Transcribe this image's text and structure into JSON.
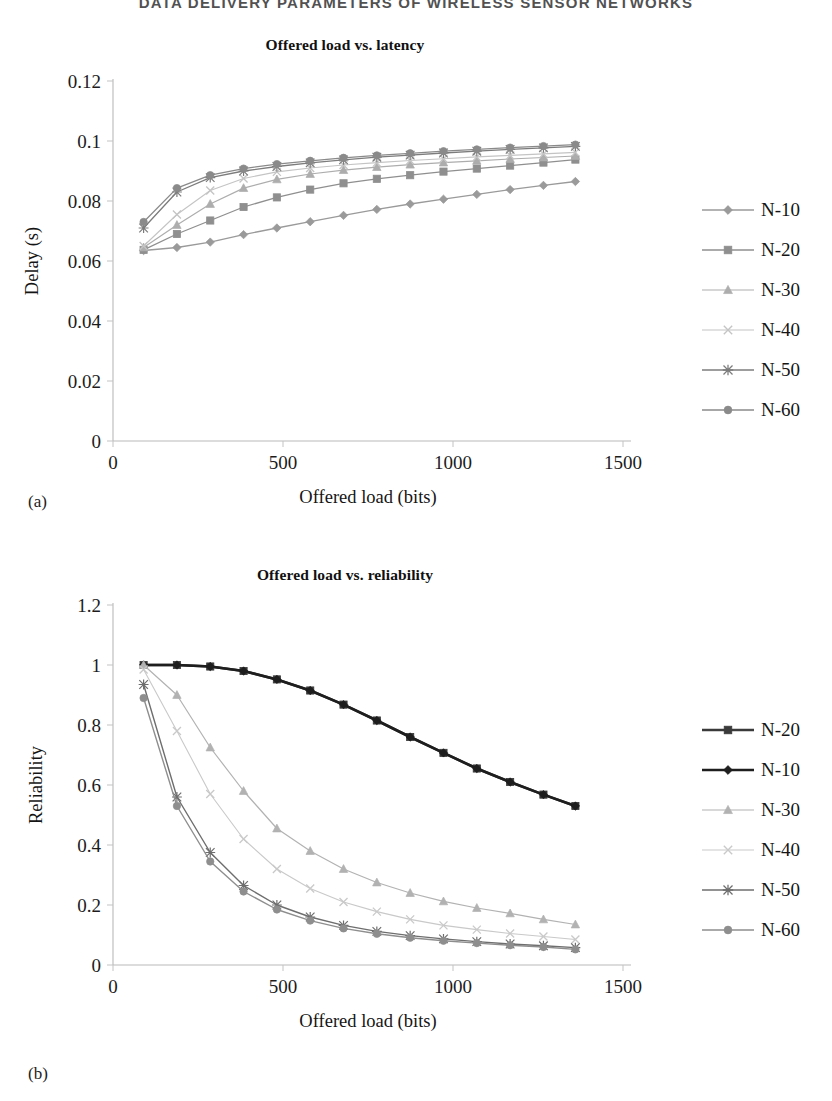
{
  "running_head": "DATA DELIVERY PARAMETERS OF WIRELESS SENSOR NETWORKS",
  "figures": [
    {
      "key": "a",
      "subfig_label": "(a)",
      "title": "Offered load vs. latency",
      "legend": [
        {
          "label": "N-10",
          "marker": "diamond",
          "color": "#9a9a9a",
          "width": 1.3
        },
        {
          "label": "N-20",
          "marker": "square",
          "color": "#8f8f8f",
          "width": 1.3
        },
        {
          "label": "N-30",
          "marker": "triangle",
          "color": "#adadad",
          "width": 1.2
        },
        {
          "label": "N-40",
          "marker": "cross",
          "color": "#c4c4c4",
          "width": 1.1
        },
        {
          "label": "N-50",
          "marker": "star",
          "color": "#7c7c7c",
          "width": 1.3
        },
        {
          "label": "N-60",
          "marker": "circle",
          "color": "#8a8a8a",
          "width": 1.3
        }
      ],
      "chart_data": {
        "type": "line",
        "title": "Offered load vs. latency",
        "xlabel": "Offered load (bits)",
        "ylabel": "Delay (s)",
        "xlim": [
          0,
          1500
        ],
        "ylim": [
          0,
          0.12
        ],
        "xticks": [
          "0",
          "500",
          "1000",
          "1500"
        ],
        "yticks": [
          "0",
          "0.02",
          "0.04",
          "0.06",
          "0.08",
          "0.1",
          "0.12"
        ],
        "grid": false,
        "legend_position": "right",
        "x": [
          90,
          188,
          286,
          384,
          482,
          580,
          678,
          776,
          874,
          972,
          1070,
          1168,
          1266,
          1360
        ],
        "series": [
          {
            "name": "N-10",
            "values": [
              0.0635,
              0.0645,
              0.0663,
              0.0688,
              0.071,
              0.0731,
              0.0752,
              0.0772,
              0.079,
              0.0806,
              0.0822,
              0.0838,
              0.0852,
              0.0865
            ]
          },
          {
            "name": "N-20",
            "values": [
              0.0637,
              0.069,
              0.0735,
              0.078,
              0.0812,
              0.0838,
              0.0859,
              0.0874,
              0.0886,
              0.0898,
              0.0908,
              0.0918,
              0.0928,
              0.0938
            ]
          },
          {
            "name": "N-30",
            "values": [
              0.0645,
              0.072,
              0.079,
              0.0843,
              0.0872,
              0.089,
              0.0903,
              0.0913,
              0.0921,
              0.0928,
              0.0934,
              0.094,
              0.0945,
              0.095
            ]
          },
          {
            "name": "N-40",
            "values": [
              0.065,
              0.0755,
              0.0835,
              0.0875,
              0.0897,
              0.091,
              0.092,
              0.0928,
              0.0935,
              0.0941,
              0.0947,
              0.0952,
              0.0957,
              0.0962
            ]
          },
          {
            "name": "N-50",
            "values": [
              0.071,
              0.083,
              0.0878,
              0.09,
              0.0915,
              0.0927,
              0.0937,
              0.0946,
              0.0953,
              0.096,
              0.0966,
              0.0972,
              0.0977,
              0.0982
            ]
          },
          {
            "name": "N-60",
            "values": [
              0.073,
              0.0843,
              0.0886,
              0.0908,
              0.0923,
              0.0934,
              0.0944,
              0.0952,
              0.0959,
              0.0966,
              0.0972,
              0.0978,
              0.0983,
              0.0988
            ]
          }
        ]
      }
    },
    {
      "key": "b",
      "subfig_label": "(b)",
      "title": "Offered load vs. reliability",
      "legend": [
        {
          "label": "N-20",
          "marker": "square",
          "color": "#3a3a3a",
          "width": 2.6
        },
        {
          "label": "N-10",
          "marker": "diamond",
          "color": "#1e1e1e",
          "width": 2.6
        },
        {
          "label": "N-30",
          "marker": "triangle",
          "color": "#b2b2b2",
          "width": 1.2
        },
        {
          "label": "N-40",
          "marker": "cross",
          "color": "#c9c9c9",
          "width": 1.1
        },
        {
          "label": "N-50",
          "marker": "star",
          "color": "#6e6e6e",
          "width": 1.4
        },
        {
          "label": "N-60",
          "marker": "circle",
          "color": "#8e8e8e",
          "width": 1.4
        }
      ],
      "chart_data": {
        "type": "line",
        "title": "Offered load vs. reliability",
        "xlabel": "Offered load (bits)",
        "ylabel": "Reliability",
        "xlim": [
          0,
          1500
        ],
        "ylim": [
          0,
          1.2
        ],
        "xticks": [
          "0",
          "500",
          "1000",
          "1500"
        ],
        "yticks": [
          "0",
          "0.2",
          "0.4",
          "0.6",
          "0.8",
          "1",
          "1.2"
        ],
        "grid": false,
        "legend_position": "right",
        "x": [
          90,
          188,
          286,
          384,
          482,
          580,
          678,
          776,
          874,
          972,
          1070,
          1168,
          1266,
          1360
        ],
        "series": [
          {
            "name": "N-20",
            "values": [
              1.0,
              1.0,
              0.995,
              0.98,
              0.952,
              0.915,
              0.868,
              0.815,
              0.76,
              0.707,
              0.655,
              0.61,
              0.568,
              0.53
            ]
          },
          {
            "name": "N-10",
            "values": [
              1.0,
              1.0,
              0.995,
              0.98,
              0.952,
              0.915,
              0.868,
              0.815,
              0.76,
              0.707,
              0.655,
              0.61,
              0.568,
              0.53
            ]
          },
          {
            "name": "N-30",
            "values": [
              1.0,
              0.9,
              0.725,
              0.58,
              0.455,
              0.38,
              0.32,
              0.275,
              0.24,
              0.212,
              0.19,
              0.172,
              0.152,
              0.135
            ]
          },
          {
            "name": "N-40",
            "values": [
              0.985,
              0.78,
              0.57,
              0.42,
              0.32,
              0.255,
              0.21,
              0.178,
              0.152,
              0.132,
              0.118,
              0.105,
              0.095,
              0.085
            ]
          },
          {
            "name": "N-50",
            "values": [
              0.935,
              0.56,
              0.375,
              0.265,
              0.2,
              0.16,
              0.132,
              0.112,
              0.098,
              0.087,
              0.078,
              0.07,
              0.064,
              0.058
            ]
          },
          {
            "name": "N-60",
            "values": [
              0.89,
              0.53,
              0.345,
              0.245,
              0.185,
              0.148,
              0.122,
              0.104,
              0.091,
              0.081,
              0.073,
              0.066,
              0.06,
              0.052
            ]
          }
        ]
      }
    }
  ]
}
